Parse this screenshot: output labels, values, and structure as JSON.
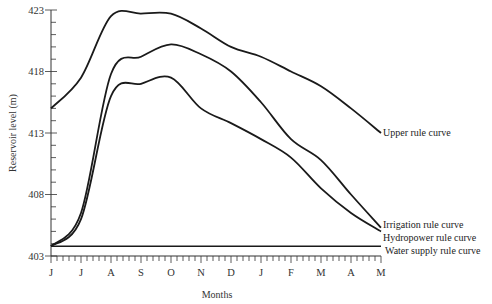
{
  "chart_data": {
    "type": "line",
    "title": "",
    "xlabel": "Months",
    "ylabel": "Reservoir  level (m)",
    "categories": [
      "J",
      "J",
      "A",
      "S",
      "O",
      "N",
      "D",
      "J",
      "F",
      "M",
      "A",
      "M"
    ],
    "yticks": [
      403,
      408,
      413,
      418,
      423
    ],
    "ylim": [
      403,
      423
    ],
    "grid": false,
    "legend": "inline labels at right end of curves",
    "series": [
      {
        "name": "Upper rule curve",
        "values": [
          415.0,
          417.5,
          422.5,
          422.7,
          422.7,
          421.5,
          420.0,
          419.2,
          418.0,
          416.8,
          415.0,
          413.0
        ]
      },
      {
        "name": "Irrigation rule curve",
        "values": [
          403.8,
          406.5,
          417.8,
          419.2,
          420.2,
          419.4,
          418.0,
          415.5,
          412.5,
          410.8,
          408.0,
          405.3
        ]
      },
      {
        "name": "Hydropower rule curve",
        "values": [
          403.8,
          406.0,
          416.0,
          417.0,
          417.5,
          415.0,
          413.8,
          412.5,
          411.0,
          408.5,
          406.5,
          405.0
        ]
      },
      {
        "name": "Water supply rule curve",
        "values": [
          403.8,
          403.8,
          403.8,
          403.8,
          403.8,
          403.8,
          403.8,
          403.8,
          403.8,
          403.8,
          403.8,
          403.8
        ]
      }
    ]
  },
  "axis": {
    "y_labels": [
      "423",
      "418",
      "413",
      "408",
      "403"
    ],
    "x_labels": [
      "J",
      "J",
      "A",
      "S",
      "O",
      "N",
      "D",
      "J",
      "F",
      "M",
      "A",
      "M"
    ],
    "x_title": "Months",
    "y_title": "Reservoir  level (m)"
  },
  "labels": {
    "upper": "Upper rule curve",
    "irrigation": "Irrigation rule curve",
    "hydropower": "Hydropower rule curve",
    "water_supply": "Water supply rule curve"
  }
}
